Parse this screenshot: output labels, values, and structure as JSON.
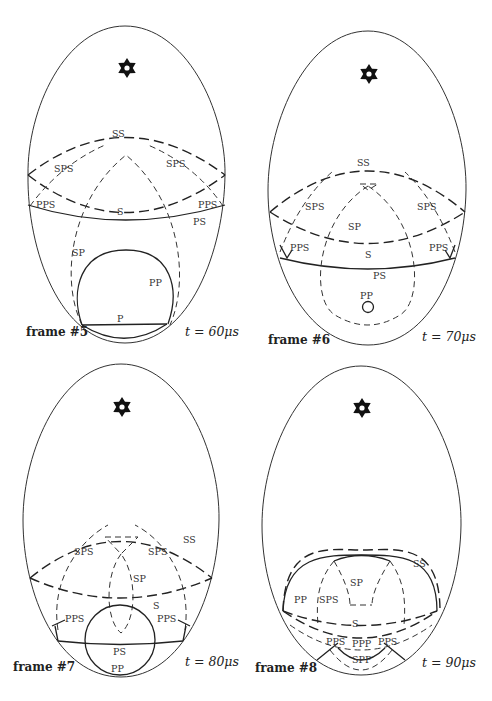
{
  "figure": {
    "frames": [
      {
        "id": "frame-5",
        "label": "frame #5",
        "time": "t = 60μs",
        "source_icon": "star-icon",
        "waves": {
          "SS": "SS",
          "SPS_left": "SPS",
          "SPS_right": "SPS",
          "PPS_left": "PPS",
          "PPS_right": "PPS",
          "S": "S",
          "PS": "PS",
          "SP": "SP",
          "PP": "PP",
          "P": "P"
        }
      },
      {
        "id": "frame-6",
        "label": "frame #6",
        "time": "t = 70μs",
        "source_icon": "star-icon",
        "waves": {
          "SS": "SS",
          "SPS_left": "SPS",
          "SPS_right": "SPS",
          "SP": "SP",
          "PPS_left": "PPS",
          "PPS_right": "PPS",
          "S": "S",
          "PS": "PS",
          "PP": "PP"
        }
      },
      {
        "id": "frame-7",
        "label": "frame #7",
        "time": "t = 80μs",
        "source_icon": "star-icon",
        "waves": {
          "SS": "SS",
          "SPS_left": "SPS",
          "SPS_right": "SPS",
          "SP": "SP",
          "S": "S",
          "PPS_left": "PPS",
          "PPS_right": "PPS",
          "PS": "PS",
          "PP": "PP"
        }
      },
      {
        "id": "frame-8",
        "label": "frame #8",
        "time": "t = 90μs",
        "source_icon": "star-icon",
        "waves": {
          "SS": "SS",
          "SP": "SP",
          "PP": "PP",
          "SPS": "SPS",
          "S": "S",
          "PPS_left": "PPS",
          "PPP": "PPP",
          "PPS_right": "PPS",
          "SPP": "SPP"
        }
      }
    ]
  }
}
